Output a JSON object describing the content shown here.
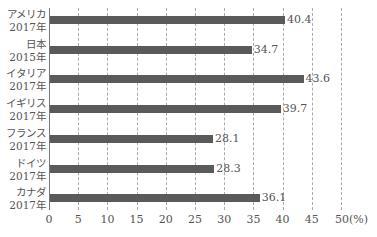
{
  "chart_data": {
    "type": "bar",
    "orientation": "horizontal",
    "title": "",
    "xlabel": "(%)",
    "ylabel": "",
    "xlim": [
      0,
      50
    ],
    "x_ticks": [
      "0",
      "5",
      "10",
      "15",
      "20",
      "25",
      "30",
      "35",
      "40",
      "45",
      "50"
    ],
    "x_unit": "(%)",
    "grid": "vertical dashed",
    "legend": null,
    "categories": [
      {
        "name": "アメリカ",
        "year": "2017年"
      },
      {
        "name": "日本",
        "year": "2015年"
      },
      {
        "name": "イタリア",
        "year": "2017年"
      },
      {
        "name": "イギリス",
        "year": "2017年"
      },
      {
        "name": "フランス",
        "year": "2017年"
      },
      {
        "name": "ドイツ",
        "year": "2017年"
      },
      {
        "name": "カナダ",
        "year": "2017年"
      }
    ],
    "values": [
      40.4,
      34.7,
      43.6,
      39.7,
      28.1,
      28.3,
      36.1
    ],
    "value_labels": [
      "40.4",
      "34.7",
      "43.6",
      "39.7",
      "28.1",
      "28.3",
      "36.1"
    ],
    "bar_color": "#5a5a5a"
  }
}
